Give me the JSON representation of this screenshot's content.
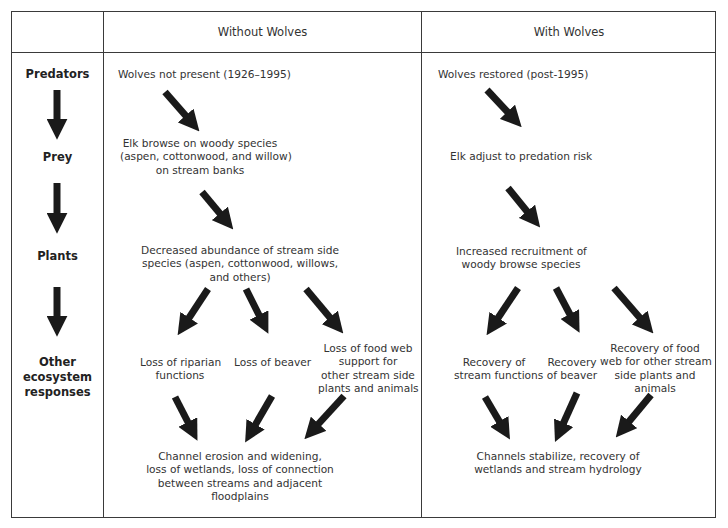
{
  "diagram": {
    "type": "trophic-cascade-comparison-table",
    "header": {
      "corner_label": "",
      "columns": [
        "Without Wolves",
        "With Wolves"
      ]
    },
    "row_labels": {
      "predators": "Predators",
      "prey": "Prey",
      "plants": "Plants",
      "other_line1": "Other",
      "other_line2": "ecosystem",
      "other_line3": "responses"
    },
    "without_wolves": {
      "predators": "Wolves not present (1926–1995)",
      "prey": [
        "Elk browse on woody species",
        "(aspen, cottonwood, and willow)",
        "on stream banks"
      ],
      "plants": [
        "Decreased abundance of stream side",
        "species (aspen, cottonwood, willows,",
        "and others)"
      ],
      "responses": [
        [
          "Loss of riparian",
          "functions"
        ],
        [
          "Loss of beaver"
        ],
        [
          "Loss of food web",
          "support for",
          "other stream side",
          "plants and animals"
        ]
      ],
      "outcome": [
        "Channel erosion and widening,",
        "loss of wetlands, loss of connection",
        "between streams and adjacent",
        "floodplains"
      ]
    },
    "with_wolves": {
      "predators": "Wolves restored (post-1995)",
      "prey": [
        "Elk adjust to predation risk"
      ],
      "plants": [
        "Increased recruitment of",
        "woody browse species"
      ],
      "responses": [
        [
          "Recovery of",
          "stream functions"
        ],
        [
          "Recovery",
          "of beaver"
        ],
        [
          "Recovery of food",
          "web for other stream",
          "side plants and",
          "animals"
        ]
      ],
      "outcome": [
        "Channels stabilize, recovery of",
        "wetlands and stream hydrology"
      ]
    },
    "colors": {
      "border": "#3a3a3a",
      "arrow": "#1a1a1a",
      "text": "#333333",
      "background": "#ffffff"
    }
  }
}
